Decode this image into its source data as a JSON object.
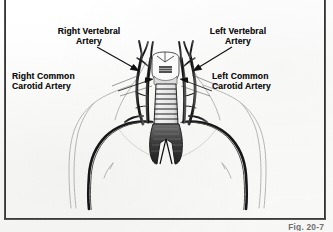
{
  "figure": {
    "caption": "Fig. 20-7"
  },
  "labels": {
    "right_vertebral": "Right Vertebral\nArtery",
    "right_vertebral_line1": "Right Vertebral",
    "right_vertebral_line2": "Artery",
    "left_vertebral_line1": "Left Vertebral",
    "left_vertebral_line2": "Artery",
    "right_carotid_line1": "Right Common",
    "right_carotid_line2": "Carotid Artery",
    "left_carotid_line1": "Left Common",
    "left_carotid_line2": "Carotid Artery"
  },
  "colors": {
    "ink": "#0d0d0d",
    "vessel_dark": "#151515",
    "outline_light": "#9a9a9a",
    "page": "#fdfdfc",
    "caption_gray": "#6f6f6f"
  },
  "anatomy": {
    "structures": [
      "trachea",
      "thyroid cartilage",
      "right vertebral artery",
      "left vertebral artery",
      "right common carotid artery",
      "left common carotid artery",
      "aortic arch",
      "right subclavian artery",
      "left subclavian artery",
      "brachiocephalic trunk",
      "main bronchi",
      "torso outline",
      "shoulder outline"
    ]
  }
}
